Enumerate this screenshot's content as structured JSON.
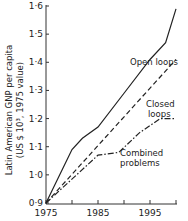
{
  "chart_data": {
    "type": "line",
    "title": "",
    "xlabel": "",
    "ylabel": "Latin American GNP per capita (US $ 10³, 1975 value)",
    "ylabel_line1": "Latin American GNP per capita",
    "ylabel_line2": "(US $ 10³, 1975 value)",
    "xlim": [
      1975,
      2000
    ],
    "ylim": [
      0.9,
      1.6
    ],
    "x_ticks": [
      1975,
      1980,
      1985,
      1990,
      1995,
      2000
    ],
    "x_tick_labels": [
      "1975",
      "1985",
      "1995"
    ],
    "y_ticks": [
      0.9,
      1.0,
      1.1,
      1.2,
      1.3,
      1.4,
      1.5,
      1.6
    ],
    "y_tick_labels": [
      "0·9",
      "1·0",
      "1·1",
      "1·2",
      "1·3",
      "1·4",
      "1·5",
      "1·6"
    ],
    "grid": false,
    "legend": "inline labels",
    "series": [
      {
        "name": "Open loops",
        "style": "solid",
        "x": [
          1975,
          1980,
          1982,
          1985,
          1990,
          1995,
          1998,
          2000
        ],
        "y": [
          0.9,
          1.09,
          1.13,
          1.17,
          1.29,
          1.41,
          1.47,
          1.59
        ]
      },
      {
        "name": "Closed loops",
        "style": "dashed",
        "x": [
          1975,
          2000
        ],
        "y": [
          0.9,
          1.41
        ]
      },
      {
        "name": "Combined problems",
        "style": "dash-dot",
        "x": [
          1975,
          1985,
          1989,
          1993,
          1997,
          2000
        ],
        "y": [
          0.9,
          1.07,
          1.08,
          1.15,
          1.2,
          1.2
        ]
      }
    ],
    "annotations": [
      "Open loops",
      "Closed loops",
      "Combined problems"
    ]
  },
  "labels": {
    "open": "Open loops",
    "closed1": "Closed",
    "closed2": "loops",
    "combined1": "Combined",
    "combined2": "problems"
  }
}
